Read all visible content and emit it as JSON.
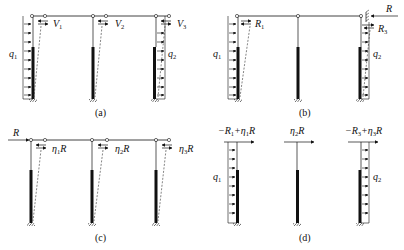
{
  "figure": {
    "panels": [
      {
        "id": "a",
        "caption": "(a)",
        "load_labels": {
          "left": "q",
          "left_sub": "1",
          "right": "q",
          "right_sub": "2"
        },
        "spring_labels": [
          {
            "main": "V",
            "sub": "1"
          },
          {
            "main": "V",
            "sub": "2"
          },
          {
            "main": "V",
            "sub": "3"
          }
        ]
      },
      {
        "id": "b",
        "caption": "(b)",
        "load_labels": {
          "left": "q",
          "left_sub": "1",
          "right": "q",
          "right_sub": "2"
        },
        "reaction_labels": [
          {
            "main": "R",
            "sub": "1"
          },
          {
            "main": "R",
            "sub": "3"
          }
        ],
        "applied_force": "R"
      },
      {
        "id": "c",
        "caption": "(c)",
        "applied_force": "R",
        "spring_labels": [
          {
            "eta": "η",
            "sub": "1",
            "tail": "R"
          },
          {
            "eta": "η",
            "sub": "2",
            "tail": "R"
          },
          {
            "eta": "η",
            "sub": "3",
            "tail": "R"
          }
        ]
      },
      {
        "id": "d",
        "caption": "(d)",
        "load_labels": {
          "left": "q",
          "left_sub": "1",
          "right": "q",
          "right_sub": "2"
        },
        "top_forces": [
          {
            "pre": "−R",
            "pre_sub": "1",
            "mid": "+η",
            "mid_sub": "1",
            "tail": "R"
          },
          {
            "pre": "",
            "pre_sub": "",
            "mid": "η",
            "mid_sub": "2",
            "tail": "R"
          },
          {
            "pre": "−R",
            "pre_sub": "3",
            "mid": "+η",
            "mid_sub": "3",
            "tail": "R"
          }
        ]
      }
    ],
    "colors": {
      "ink": "#111111",
      "column_thick": "#111111",
      "dashed": "#333333"
    }
  }
}
